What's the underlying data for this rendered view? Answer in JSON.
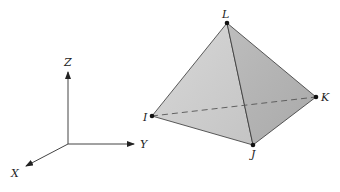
{
  "diagram": {
    "axes": {
      "origin": [
        68,
        144
      ],
      "z": {
        "label": "Z",
        "tip": [
          68,
          70
        ],
        "label_pos": [
          64,
          66
        ]
      },
      "y": {
        "label": "Y",
        "tip": [
          135,
          144
        ],
        "label_pos": [
          140,
          148
        ]
      },
      "x": {
        "label": "X",
        "tip": [
          25,
          166
        ],
        "label_pos": [
          11,
          177
        ]
      }
    },
    "tetrahedron": {
      "vertices": {
        "L": {
          "label": "L",
          "pos": [
            227,
            23
          ],
          "label_pos": [
            222,
            19
          ]
        },
        "I": {
          "label": "I",
          "pos": [
            152,
            116
          ],
          "label_pos": [
            142,
            123
          ]
        },
        "J": {
          "label": "J",
          "pos": [
            253,
            145
          ],
          "label_pos": [
            252,
            158
          ]
        },
        "K": {
          "label": "K",
          "pos": [
            316,
            97
          ],
          "label_pos": [
            323,
            102
          ]
        }
      },
      "hidden_edge": "I-K",
      "colors": {
        "face_left": "#cfcfcf",
        "face_right": "#b4b4b4",
        "edge": "#333333"
      }
    }
  }
}
